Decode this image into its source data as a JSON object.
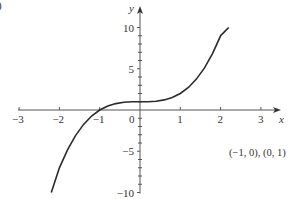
{
  "panel_label": ")",
  "chart_data": {
    "type": "line",
    "title": "",
    "xlabel": "x",
    "ylabel": "y",
    "xlim": [
      -3,
      3
    ],
    "ylim": [
      -10,
      10
    ],
    "x_ticks": [
      -3,
      -2,
      -1,
      0,
      1,
      2,
      3
    ],
    "x_tick_labels": [
      "−3",
      "−2",
      "−1",
      "0",
      "1",
      "2",
      "3"
    ],
    "y_ticks": [
      -10,
      -5,
      5,
      10
    ],
    "y_tick_labels": [
      "−10",
      "−5",
      "5",
      "10"
    ],
    "y_minor_tick_step": 1,
    "grid": false,
    "legend": null,
    "series": [
      {
        "name": "y = x^3 + 1",
        "x": [
          -2.2,
          -2.0,
          -1.8,
          -1.6,
          -1.4,
          -1.2,
          -1.0,
          -0.8,
          -0.6,
          -0.4,
          -0.2,
          0.0,
          0.2,
          0.4,
          0.6,
          0.8,
          1.0,
          1.2,
          1.4,
          1.6,
          1.8,
          2.0,
          2.1,
          2.2
        ],
        "values": [
          -10.0,
          -7.0,
          -4.83,
          -3.1,
          -1.74,
          -0.73,
          0.0,
          0.49,
          0.78,
          0.94,
          0.99,
          1.0,
          1.01,
          1.06,
          1.22,
          1.51,
          2.0,
          2.73,
          3.74,
          5.1,
          6.83,
          9.0,
          9.5,
          10.0
        ]
      }
    ],
    "annotations": [
      "(−1, 0), (0, 1)"
    ],
    "marked_points": [
      [
        -1,
        0
      ],
      [
        0,
        1
      ]
    ]
  }
}
